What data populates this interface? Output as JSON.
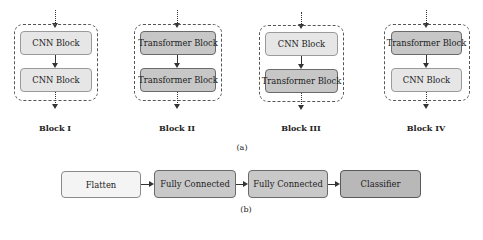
{
  "figure": {
    "part_a": {
      "caption": "(a)",
      "blocks": [
        {
          "label": "Block I",
          "top": "CNN Block",
          "bottom": "CNN Block",
          "top_type": "cnn",
          "bottom_type": "cnn"
        },
        {
          "label": "Block II",
          "top": "Transformer Block",
          "bottom": "Transformer Block",
          "top_type": "transformer",
          "bottom_type": "transformer"
        },
        {
          "label": "Block III",
          "top": "CNN Block",
          "bottom": "Transformer Block",
          "top_type": "cnn",
          "bottom_type": "transformer"
        },
        {
          "label": "Block IV",
          "top": "Transformer Block",
          "bottom": "CNN Block",
          "top_type": "transformer",
          "bottom_type": "cnn"
        }
      ]
    },
    "part_b": {
      "caption": "(b)",
      "pipeline": [
        "Flatten",
        "Fully Connected",
        "Fully Connected",
        "Classifier"
      ]
    }
  },
  "colors": {
    "cnn_fill": "#e6e6e6",
    "transformer_fill": "#c7c7c7",
    "flatten_fill": "#f4f4f4",
    "fc_fill": "#c9c9c9",
    "classifier_fill": "#b8b8b8"
  }
}
